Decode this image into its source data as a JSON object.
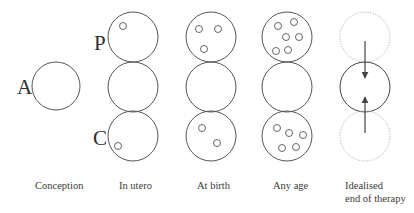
{
  "colors": {
    "stroke": "#555555",
    "faded_stroke": "#b0b0b0",
    "arrow": "#444444",
    "text": "#3a3a3a",
    "background": "#ffffff"
  },
  "letters": {
    "A": "A",
    "P": "P",
    "C": "C"
  },
  "stages": [
    {
      "id": "conception",
      "label": "Conception"
    },
    {
      "id": "in-utero",
      "label": "In utero"
    },
    {
      "id": "at-birth",
      "label": "At birth"
    },
    {
      "id": "any-age",
      "label": "Any age"
    },
    {
      "id": "idealised",
      "label_line1": "Idealised",
      "label_line2": "end of therapy"
    }
  ],
  "geometry": {
    "main_circle_radius": 25,
    "conception_circle": {
      "cx": 56,
      "cy": 86,
      "r": 24
    },
    "columns_cx": [
      133,
      211,
      287,
      365
    ],
    "rows_cy": [
      37,
      87,
      136
    ],
    "dot_radius": 3.5
  },
  "dots": {
    "in_utero": {
      "top": [
        [
          123,
          26
        ]
      ],
      "bottom": [
        [
          118,
          146
        ]
      ]
    },
    "at_birth": {
      "top": [
        [
          199,
          29
        ],
        [
          218,
          29
        ],
        [
          204,
          49
        ]
      ],
      "bottom": [
        [
          202,
          128
        ],
        [
          217,
          143
        ]
      ]
    },
    "any_age": {
      "top": [
        [
          278,
          26
        ],
        [
          294,
          22
        ],
        [
          286,
          37
        ],
        [
          299,
          37
        ],
        [
          276,
          51
        ],
        [
          288,
          50
        ]
      ],
      "bottom": [
        [
          277,
          128
        ],
        [
          289,
          133
        ],
        [
          303,
          135
        ],
        [
          282,
          148
        ],
        [
          296,
          147
        ]
      ]
    }
  },
  "arrows": {
    "down": {
      "x": 365,
      "y1": 41,
      "y2": 78
    },
    "up": {
      "x": 365,
      "y1": 133,
      "y2": 97
    }
  }
}
